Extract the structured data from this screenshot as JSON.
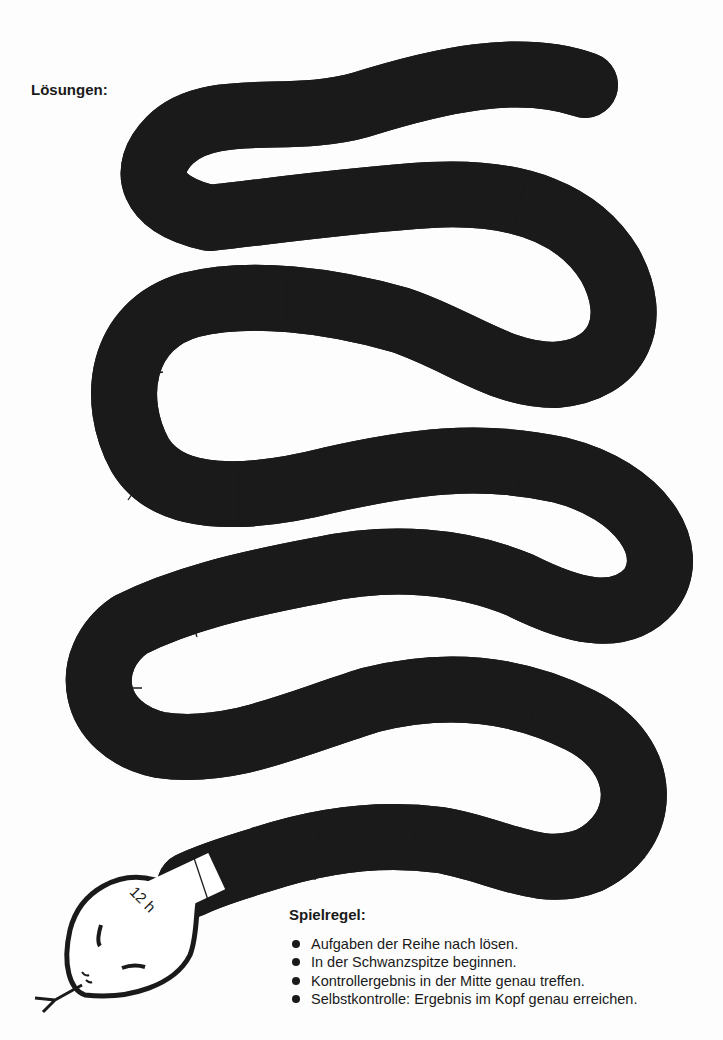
{
  "header": {
    "title": "Lösungen:"
  },
  "snake": {
    "tail_label": "2 h 15 min",
    "cells": [
      {
        "text": "+ 45 min =",
        "type": "op"
      },
      {
        "text": "3 h",
        "type": "result"
      },
      {
        "text": "+ 35 min =",
        "type": "op"
      },
      {
        "text": "3 h 35 min",
        "type": "result"
      },
      {
        "text": "+ 25 min =",
        "type": "op"
      },
      {
        "text": "4 h",
        "type": "result"
      },
      {
        "text": "+ 38 min =",
        "type": "op"
      },
      {
        "text": "4 h 38 min",
        "type": "result"
      },
      {
        "text": "+ 12 min =",
        "type": "op"
      },
      {
        "text": "4 h 50 min",
        "type": "result"
      },
      {
        "text": "+ 50 min =",
        "type": "op"
      },
      {
        "text": "5 h 40 min",
        "type": "result"
      },
      {
        "text": "+ 40 min =",
        "type": "op"
      },
      {
        "text": "6 h 20 min",
        "type": "result"
      },
      {
        "text": "+ 35 min =",
        "type": "op"
      },
      {
        "text": "6 h 55 min",
        "type": "result"
      },
      {
        "text": "+ 55 min =",
        "type": "op"
      },
      {
        "text": "7 h 50 min",
        "type": "result"
      },
      {
        "text": "+ 18 min =",
        "type": "op"
      },
      {
        "text": "8 h 8 min",
        "type": "result"
      },
      {
        "text": "+ 26 min =",
        "type": "op"
      },
      {
        "text": "8 h 34 min",
        "type": "result"
      },
      {
        "text": "+ 45 min =",
        "type": "op"
      },
      {
        "text": "9 h 19 min",
        "type": "result"
      },
      {
        "text": "+ 15 min =",
        "type": "op"
      },
      {
        "text": "9 h 34 min",
        "type": "result"
      },
      {
        "text": "+ 25 min =",
        "type": "op"
      },
      {
        "text": "9 h 59 min",
        "type": "result"
      },
      {
        "text": "+ 21 min =",
        "type": "op"
      },
      {
        "text": "10 h 20 min",
        "type": "result"
      },
      {
        "text": "+ 59 min =",
        "type": "op"
      },
      {
        "text": "11 h 19 min",
        "type": "result"
      },
      {
        "text": "+ 29 min =",
        "type": "op"
      },
      {
        "text": "11 h 48 min",
        "type": "result"
      },
      {
        "text": "+ 12 min =",
        "type": "op"
      }
    ],
    "head_label": "12 h"
  },
  "rules": {
    "title": "Spielregel:",
    "items": [
      "Aufgaben der Reihe nach lösen.",
      "In der Schwanzspitze beginnen.",
      "Kontrollergebnis in der Mitte genau treffen.",
      "Selbstkontrolle: Ergebnis im Kopf genau erreichen."
    ]
  },
  "colors": {
    "ink": "#1a1a1a",
    "paper": "#fdfdfd"
  }
}
